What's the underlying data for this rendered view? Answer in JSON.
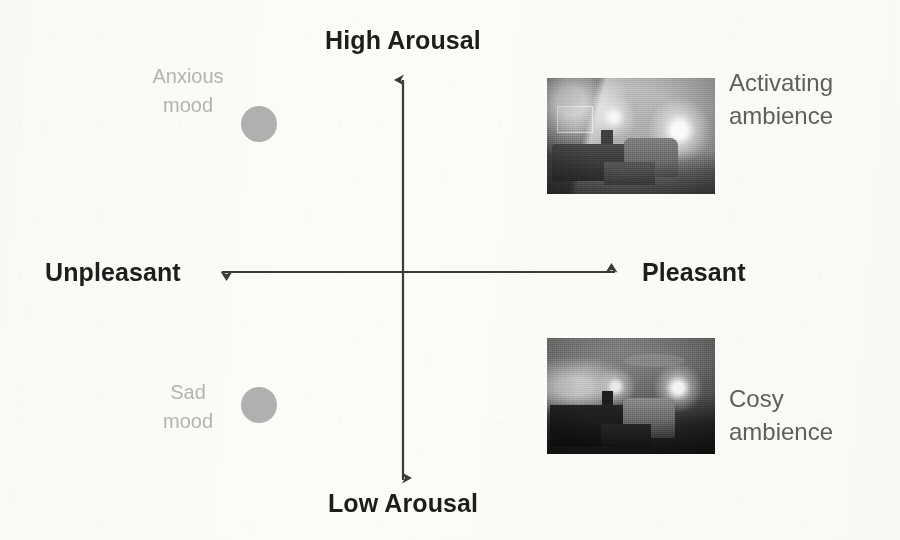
{
  "figure": {
    "type": "quadrant-diagram",
    "background_color": "#fbfbfa",
    "axis_color": "#3a3a3a"
  },
  "axes": {
    "vertical": {
      "top_label": "High Arousal",
      "bottom_label": "Low Arousal"
    },
    "horizontal": {
      "left_label": "Unpleasant",
      "right_label": "Pleasant"
    }
  },
  "markers": [
    {
      "id": "anxious-mood",
      "label_line1": "Anxious",
      "label_line2": "mood",
      "label": "Anxious mood",
      "quadrant": "upper-left",
      "dot_color": "#b0b0b0",
      "text_color": "#b3b3b3"
    },
    {
      "id": "sad-mood",
      "label_line1": "Sad",
      "label_line2": "mood",
      "label": "Sad mood",
      "quadrant": "lower-left",
      "dot_color": "#b0b0b0",
      "text_color": "#b3b3b3"
    }
  ],
  "photos": [
    {
      "id": "activating-ambience",
      "caption_line1": "Activating",
      "caption_line2": "ambience",
      "caption": "Activating ambience",
      "quadrant": "upper-right",
      "description": "Greyscale photo of a brightly lit living room with sofa, armchair, table and lamps",
      "text_color": "#5e5e5e"
    },
    {
      "id": "cosy-ambience",
      "caption_line1": "Cosy",
      "caption_line2": "ambience",
      "caption": "Cosy ambience",
      "quadrant": "lower-right",
      "description": "Greyscale photo of the same living room dimly lit with warm pooled lamp light",
      "text_color": "#5e5e5e"
    }
  ]
}
